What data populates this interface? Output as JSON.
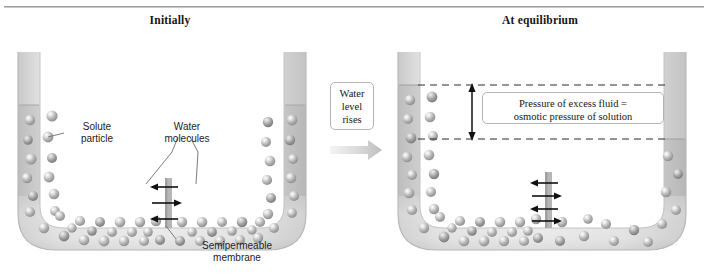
{
  "figure": {
    "kind": "osmosis-u-tube-diagram",
    "panels": [
      {
        "id": "initially",
        "title": "Initially"
      },
      {
        "id": "equilibrium",
        "title": "At equilibrium"
      }
    ]
  },
  "labels": {
    "solute_particle": "Solute\nparticle",
    "water_molecules": "Water\nmolecules",
    "semipermeable_membrane": "Semipermeable\nmembrane"
  },
  "notes": {
    "water_level_rises": "Water\nlevel\nrises",
    "pressure_equation": "Pressure of excess fluid =\nosmotic pressure of solution"
  },
  "left_panel": {
    "left_arm_fluid_level_y": 105,
    "right_arm_fluid_level_y": 105,
    "membrane_x": 168,
    "arrow_count": 3,
    "arrow_directions": [
      "left",
      "right",
      "left"
    ]
  },
  "right_panel": {
    "left_arm_fluid_level_y": 85,
    "right_arm_fluid_level_y": 139,
    "membrane_x": 546,
    "arrow_count": 4,
    "arrow_directions": [
      "left",
      "right",
      "left",
      "right"
    ],
    "dashed_line_upper_y": 85,
    "dashed_line_lower_y": 139,
    "measure_arrow_x": 472
  },
  "colors": {
    "rule": "#8c8c8c",
    "glass": "#f2f2f2",
    "glass_edge": "#bdbdbd",
    "solution_fill": "#e2e2e2",
    "sphere": "#b5b5b5",
    "sphere_highlight": "#fbfbfb",
    "membrane": "#b0b0b0",
    "arrow": "#111111",
    "dashed": "#2b2b2b",
    "flow_arrow": "#cfcfcf",
    "text": "#1a1a1a"
  }
}
